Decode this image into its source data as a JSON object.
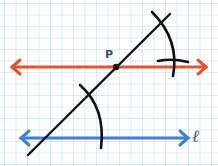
{
  "diagram": {
    "labels": {
      "point": "P",
      "line": "ℓ"
    },
    "colors": {
      "parallel_line": "#e8502e",
      "given_line": "#3f7fd6",
      "transversal": "#111111",
      "arcs": "#111111",
      "grid": "#aad7e1",
      "point": "#111111",
      "label": "#3d4a7a"
    },
    "elements": [
      {
        "id": "given-line-l",
        "type": "line-with-arrows",
        "color": "blue",
        "from": [
          20,
          138
        ],
        "to": [
          190,
          138
        ]
      },
      {
        "id": "parallel-line-through-P",
        "type": "line-with-arrows",
        "color": "red",
        "from": [
          10,
          67
        ],
        "to": [
          208,
          67
        ]
      },
      {
        "id": "transversal",
        "type": "line",
        "color": "black",
        "from": [
          28,
          155
        ],
        "to": [
          170,
          14
        ]
      },
      {
        "id": "point-P",
        "type": "point",
        "at": [
          116,
          67
        ]
      },
      {
        "id": "arc-lower",
        "type": "arc",
        "near": [
          90,
          95
        ]
      },
      {
        "id": "arc-upper",
        "type": "arc",
        "near": [
          162,
          30
        ]
      }
    ]
  }
}
